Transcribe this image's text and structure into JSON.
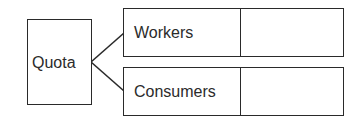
{
  "diagram": {
    "root": {
      "label": "Quota"
    },
    "children": [
      {
        "label": "Workers",
        "value": ""
      },
      {
        "label": "Consumers",
        "value": ""
      }
    ],
    "colors": {
      "stroke": "#2a2a2a",
      "text": "#2b2b2b",
      "background": "#ffffff"
    }
  }
}
